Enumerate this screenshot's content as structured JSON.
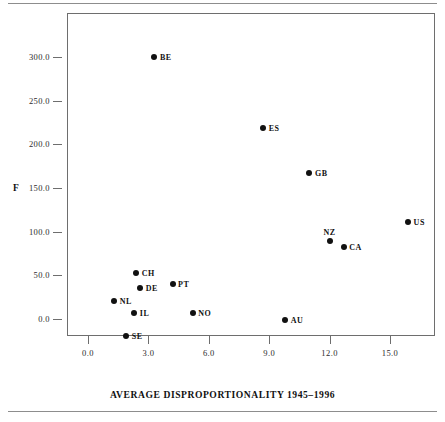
{
  "chart_data": {
    "type": "scatter",
    "title": "",
    "xlabel": "AVERAGE DISPROPORTIONALITY 1945–1996",
    "ylabel": "F",
    "xlim": [
      -1.2,
      17.0
    ],
    "ylim": [
      -30.0,
      313.0
    ],
    "xticks": [
      "0.0",
      "3.0",
      "6.0",
      "9.0",
      "12.0",
      "15.0"
    ],
    "xtick_values": [
      0.0,
      3.0,
      6.0,
      9.0,
      12.0,
      15.0
    ],
    "yticks": [
      "0.0",
      "50.0",
      "100.0",
      "150.0",
      "200.0",
      "250.0",
      "300.0"
    ],
    "ytick_values": [
      0.0,
      50.0,
      100.0,
      150.0,
      200.0,
      250.0,
      300.0
    ],
    "grid": false,
    "legend": "none",
    "points": [
      {
        "label": "BE",
        "x": 3.3,
        "y": 300.0,
        "label_pos": "right"
      },
      {
        "label": "ES",
        "x": 8.7,
        "y": 219.0,
        "label_pos": "right"
      },
      {
        "label": "GB",
        "x": 11.0,
        "y": 167.0,
        "label_pos": "right"
      },
      {
        "label": "US",
        "x": 15.9,
        "y": 111.0,
        "label_pos": "right"
      },
      {
        "label": "NZ",
        "x": 12.0,
        "y": 89.0,
        "label_pos": "above"
      },
      {
        "label": "CA",
        "x": 12.7,
        "y": 82.0,
        "label_pos": "right"
      },
      {
        "label": "CH",
        "x": 2.4,
        "y": 53.0,
        "label_pos": "right"
      },
      {
        "label": "PT",
        "x": 4.2,
        "y": 40.0,
        "label_pos": "right"
      },
      {
        "label": "DE",
        "x": 2.6,
        "y": 36.0,
        "label_pos": "right"
      },
      {
        "label": "NL",
        "x": 1.3,
        "y": 21.0,
        "label_pos": "right"
      },
      {
        "label": "IL",
        "x": 2.3,
        "y": 7.0,
        "label_pos": "right"
      },
      {
        "label": "NO",
        "x": 5.2,
        "y": 7.0,
        "label_pos": "right"
      },
      {
        "label": "AU",
        "x": 9.8,
        "y": -1.0,
        "label_pos": "right"
      },
      {
        "label": "SE",
        "x": 1.9,
        "y": -19.0,
        "label_pos": "right"
      }
    ]
  },
  "colors": {
    "marker": "#111111",
    "axis": "#6e6e6e",
    "text": "#1a1a1a",
    "rule": "#8d8d8d",
    "background": "#ffffff"
  }
}
